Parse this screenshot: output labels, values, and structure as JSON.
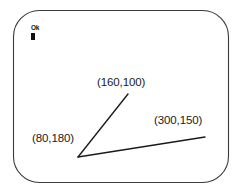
{
  "figure": {
    "type": "crt-screen-diagram",
    "canvas": {
      "width": 242,
      "height": 193,
      "background": "#ffffff"
    },
    "outline": {
      "name": "crt-screen-outline",
      "stroke": "#3a3a3a",
      "fill": "#ffffff",
      "x": 13,
      "y": 10,
      "width": 216,
      "height": 173,
      "corner_radius": 26
    },
    "prompt": {
      "text": "Ok",
      "cursor_glyph": "block-cursor",
      "x": 31,
      "y": 25,
      "color": "#101010"
    },
    "vertex": {
      "x": 78,
      "y": 157
    },
    "lines": [
      {
        "name": "upper-ray",
        "x1": 78,
        "y1": 157,
        "x2": 128,
        "y2": 94,
        "stroke": "#1a1a1a"
      },
      {
        "name": "lower-ray",
        "x1": 78,
        "y1": 157,
        "x2": 205,
        "y2": 137,
        "stroke": "#1a1a1a"
      }
    ],
    "labels": [
      {
        "id": "label-160-100",
        "text": "(160,100)",
        "x": 97,
        "y": 77,
        "color": "#1a1a1a"
      },
      {
        "id": "label-300-150",
        "text": "(300,150)",
        "x": 154,
        "y": 115,
        "color": "#1a1a1a"
      },
      {
        "id": "label-80-180",
        "text": "(80,180)",
        "x": 32,
        "y": 133,
        "color": "#1a1a1a"
      }
    ]
  }
}
